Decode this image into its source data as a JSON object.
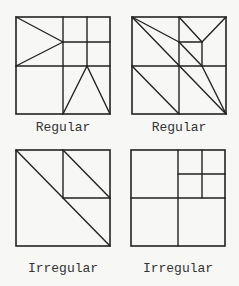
{
  "figure": {
    "stroke_color": "#222222",
    "background": "#f7f7f5",
    "panels": [
      {
        "id": "top-left",
        "label": "Regular",
        "box": [
          16,
          17,
          110,
          114
        ],
        "lines": [
          [
            63,
            17,
            63,
            114
          ],
          [
            16,
            66,
            110,
            66
          ],
          [
            87,
            17,
            87,
            66
          ],
          [
            63,
            42,
            110,
            42
          ],
          [
            16,
            17,
            63,
            42
          ],
          [
            16,
            66,
            63,
            42
          ],
          [
            63,
            114,
            87,
            66
          ],
          [
            110,
            114,
            87,
            66
          ]
        ]
      },
      {
        "id": "top-right",
        "label": "Regular",
        "box": [
          132,
          17,
          226,
          114
        ],
        "lines": [
          [
            179,
            17,
            179,
            114
          ],
          [
            132,
            66,
            226,
            66
          ],
          [
            179,
            42,
            202,
            42
          ],
          [
            202,
            42,
            202,
            66
          ],
          [
            132,
            17,
            179,
            42
          ],
          [
            132,
            17,
            226,
            114
          ],
          [
            179,
            42,
            202,
            66
          ],
          [
            179,
            17,
            202,
            42
          ],
          [
            226,
            17,
            202,
            42
          ],
          [
            132,
            66,
            179,
            114
          ],
          [
            202,
            66,
            226,
            114
          ]
        ]
      },
      {
        "id": "bottom-left",
        "label": "Irregular",
        "box": [
          16,
          150,
          110,
          246
        ],
        "lines": [
          [
            63,
            150,
            63,
            198
          ],
          [
            63,
            198,
            110,
            198
          ],
          [
            16,
            150,
            110,
            246
          ],
          [
            63,
            150,
            110,
            198
          ]
        ]
      },
      {
        "id": "bottom-right",
        "label": "Irregular",
        "box": [
          131,
          150,
          225,
          246
        ],
        "lines": [
          [
            178,
            150,
            178,
            246
          ],
          [
            131,
            198,
            225,
            198
          ],
          [
            178,
            174,
            225,
            174
          ],
          [
            202,
            150,
            202,
            198
          ]
        ]
      }
    ]
  }
}
